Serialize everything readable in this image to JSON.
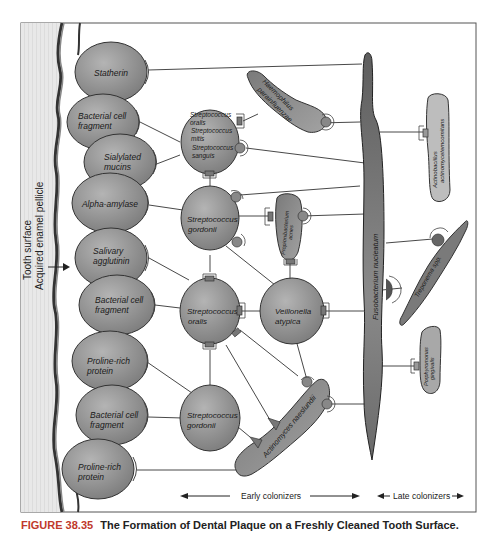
{
  "figure": {
    "number": "FIGURE 38.35",
    "title": "The Formation of Dental Plaque on a Freshly Cleaned Tooth Surface.",
    "number_color": "#c0392b"
  },
  "left_side": {
    "tooth_surface": "Tooth surface",
    "pellicle": "Acquired enamel pellicle"
  },
  "receptors": [
    {
      "line1": "Statherin",
      "line2": ""
    },
    {
      "line1": "Bacterial cell",
      "line2": "fragment"
    },
    {
      "line1": "Sialylated",
      "line2": "mucins"
    },
    {
      "line1": "Alpha-amylase",
      "line2": ""
    },
    {
      "line1": "Salivary",
      "line2": "agglutinin"
    },
    {
      "line1": "Bacterial cell",
      "line2": "fragment"
    },
    {
      "line1": "Proline-rich",
      "line2": "protein"
    },
    {
      "line1": "Bacterial cell",
      "line2": "fragment"
    },
    {
      "line1": "Proline-rich",
      "line2": "protein"
    }
  ],
  "early_colonizers": {
    "strep_group": [
      "Streptococcus",
      "oralis",
      "Streptococcus",
      "mitis",
      "Streptococcus",
      "sanguis"
    ],
    "strep_gordonii_1": [
      "Streptococcus",
      "gordonii"
    ],
    "strep_oralis": [
      "Streptococcus",
      "oralis"
    ],
    "strep_gordonii_2": [
      "Streptococcus",
      "gordonii"
    ],
    "veillonella": [
      "Veillonella",
      "atypica"
    ],
    "haemophilus": [
      "Haemophilus",
      "parainfluenzae"
    ],
    "propionibacterium": [
      "Propionibacterium",
      "acnes"
    ],
    "actinomyces": "Actinomyces naeslundii"
  },
  "bridge": {
    "fusobacterium": "Fusobacterium nucleatum"
  },
  "late_colonizers": {
    "actinobacillus": [
      "Actinobacillus",
      "actinomycetemcomitans"
    ],
    "treponema": "Treponema spp.",
    "porphyromonas": [
      "Porphyromonas",
      "gingivalis"
    ]
  },
  "axis": {
    "early": "Early colonizers",
    "late": "Late colonizers"
  },
  "colors": {
    "cell_fill": "#8c8c8c",
    "dark_fill": "#6e6e6e",
    "tooth_fill": "#e6e6e6",
    "frame": "#555555"
  }
}
